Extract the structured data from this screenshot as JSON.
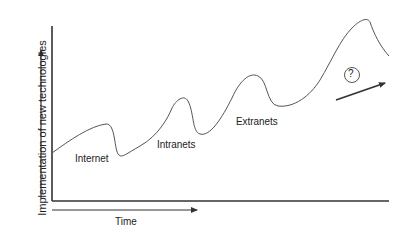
{
  "diagram": {
    "y_axis_label": "Implementation of new technologies",
    "x_axis_label": "Time",
    "phases": [
      {
        "label": "Internet"
      },
      {
        "label": "Intranets"
      },
      {
        "label": "Extranets"
      }
    ],
    "future_marker": "?",
    "line_color": "#555555",
    "axis_color": "#333333"
  }
}
